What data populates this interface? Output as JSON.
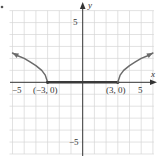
{
  "chart_data": {
    "type": "line",
    "title": "",
    "xlabel": "x",
    "ylabel": "y",
    "xlim": [
      -6,
      6
    ],
    "ylim": [
      -6,
      6
    ],
    "grid": true,
    "xticks_labeled": [
      -5,
      5
    ],
    "yticks_labeled": [
      5,
      -5
    ],
    "tick_labels": {
      "x_neg5": "−5",
      "x_pos5": "5",
      "y_pos5": "5",
      "y_neg5": "−5"
    },
    "annotations": [
      {
        "text": "(−3, 0)",
        "x": -3,
        "y": 0
      },
      {
        "text": "(3, 0)",
        "x": 3,
        "y": 0
      }
    ],
    "series": [
      {
        "name": "left-branch",
        "points": [
          [
            -6,
            2.45
          ],
          [
            -5.5,
            2.2
          ],
          [
            -5,
            2.0
          ],
          [
            -4.5,
            1.7
          ],
          [
            -4,
            1.4
          ],
          [
            -3.5,
            1.0
          ],
          [
            -3.2,
            0.6
          ],
          [
            -3,
            0
          ]
        ],
        "arrow_at_start": true
      },
      {
        "name": "flat-segment",
        "points": [
          [
            -3,
            0
          ],
          [
            3,
            0
          ]
        ],
        "closed_endpoints": true
      },
      {
        "name": "right-branch",
        "points": [
          [
            3,
            0
          ],
          [
            3.2,
            0.6
          ],
          [
            3.5,
            1.0
          ],
          [
            4,
            1.4
          ],
          [
            4.5,
            1.7
          ],
          [
            5,
            2.0
          ],
          [
            5.5,
            2.2
          ],
          [
            6,
            2.45
          ]
        ],
        "arrow_at_end": true
      }
    ],
    "colors": {
      "curve": "#6b6b6b",
      "segment": "#3a3a3a",
      "axis": "#333333",
      "grid": "#d6d6d6"
    }
  },
  "labels": {
    "x_axis_name": "x",
    "y_axis_name": "y",
    "x_neg5": "−5",
    "x_pos5": "5",
    "y_pos5": "5",
    "y_neg5": "−5",
    "point_left": "(−3, 0)",
    "point_right": "(3, 0)"
  }
}
